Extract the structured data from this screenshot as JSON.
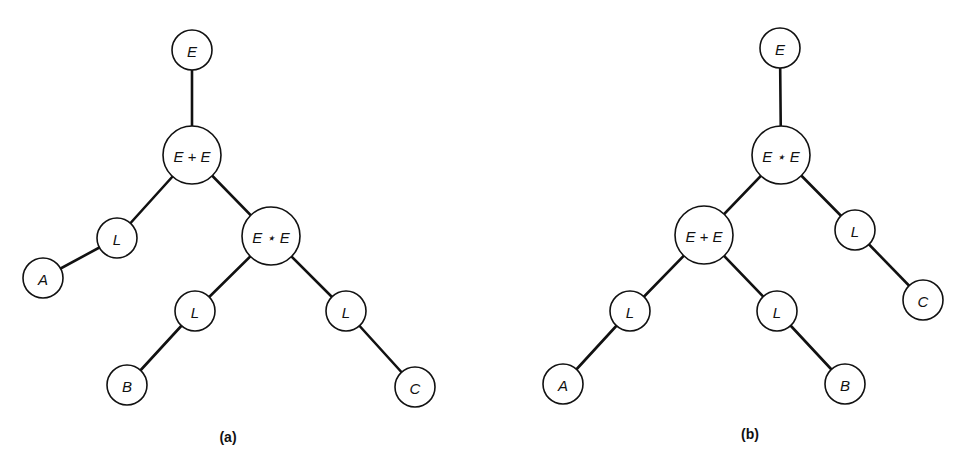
{
  "figure": {
    "style": {
      "stroke_color": "#111111",
      "background": "#ffffff"
    },
    "trees": [
      {
        "id": "a",
        "caption": "(a)",
        "caption_pos": [
          228,
          437
        ],
        "nodes": [
          {
            "id": "a0",
            "label": "E",
            "x": 192,
            "y": 50,
            "r": 20
          },
          {
            "id": "a1",
            "label": "E + E",
            "x": 192,
            "y": 155,
            "r": 29
          },
          {
            "id": "a2",
            "label": "L",
            "x": 117,
            "y": 238,
            "r": 20
          },
          {
            "id": "a3",
            "label": "E ⋆ E",
            "x": 271,
            "y": 236,
            "r": 29
          },
          {
            "id": "a4",
            "label": "A",
            "x": 43,
            "y": 278,
            "r": 20
          },
          {
            "id": "a5",
            "label": "L",
            "x": 195,
            "y": 311,
            "r": 20
          },
          {
            "id": "a6",
            "label": "L",
            "x": 346,
            "y": 311,
            "r": 20
          },
          {
            "id": "a7",
            "label": "B",
            "x": 127,
            "y": 385,
            "r": 20
          },
          {
            "id": "a8",
            "label": "C",
            "x": 415,
            "y": 387,
            "r": 20
          }
        ],
        "edges": [
          [
            "a0",
            "a1"
          ],
          [
            "a1",
            "a2"
          ],
          [
            "a1",
            "a3"
          ],
          [
            "a2",
            "a4"
          ],
          [
            "a3",
            "a5"
          ],
          [
            "a3",
            "a6"
          ],
          [
            "a5",
            "a7"
          ],
          [
            "a6",
            "a8"
          ]
        ]
      },
      {
        "id": "b",
        "caption": "(b)",
        "caption_pos": [
          750,
          434
        ],
        "nodes": [
          {
            "id": "b0",
            "label": "E",
            "x": 780,
            "y": 48,
            "r": 20
          },
          {
            "id": "b1",
            "label": "E ⋆ E",
            "x": 781,
            "y": 155,
            "r": 29
          },
          {
            "id": "b2",
            "label": "E + E",
            "x": 704,
            "y": 235,
            "r": 29
          },
          {
            "id": "b3",
            "label": "L",
            "x": 855,
            "y": 230,
            "r": 20
          },
          {
            "id": "b4",
            "label": "L",
            "x": 630,
            "y": 311,
            "r": 20
          },
          {
            "id": "b5",
            "label": "L",
            "x": 777,
            "y": 311,
            "r": 20
          },
          {
            "id": "b6",
            "label": "C",
            "x": 923,
            "y": 300,
            "r": 20
          },
          {
            "id": "b7",
            "label": "A",
            "x": 563,
            "y": 384,
            "r": 20
          },
          {
            "id": "b8",
            "label": "B",
            "x": 845,
            "y": 384,
            "r": 20
          }
        ],
        "edges": [
          [
            "b0",
            "b1"
          ],
          [
            "b1",
            "b2"
          ],
          [
            "b1",
            "b3"
          ],
          [
            "b2",
            "b4"
          ],
          [
            "b2",
            "b5"
          ],
          [
            "b3",
            "b6"
          ],
          [
            "b4",
            "b7"
          ],
          [
            "b5",
            "b8"
          ]
        ]
      }
    ]
  }
}
